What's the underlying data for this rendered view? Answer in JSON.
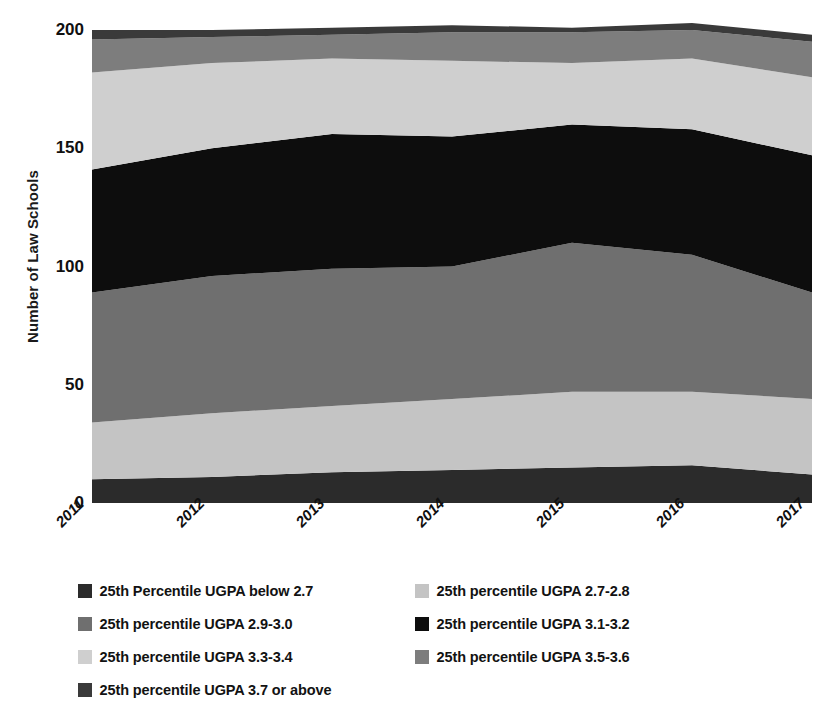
{
  "chart_data": {
    "type": "area",
    "stacked": true,
    "title": "",
    "xlabel": "",
    "ylabel": "Number of Law Schools",
    "x": [
      "2011",
      "2012",
      "2013",
      "2014",
      "2015",
      "2016",
      "2017"
    ],
    "categories": [
      "2011",
      "2012",
      "2013",
      "2014",
      "2015",
      "2016",
      "2017"
    ],
    "ylim": [
      0,
      200
    ],
    "yticks": [
      0,
      50,
      100,
      150,
      200
    ],
    "ytick_labels": [
      "0",
      "50",
      "100",
      "150",
      "200"
    ],
    "grid": false,
    "legend_position": "bottom",
    "series": [
      {
        "name": "25th Percentile UGPA below 2.7",
        "color": "#2b2b2b",
        "values": [
          10,
          11,
          13,
          14,
          15,
          16,
          12
        ]
      },
      {
        "name": "25th percentile UGPA 2.7-2.8",
        "color": "#c4c4c4",
        "values": [
          24,
          27,
          28,
          30,
          32,
          31,
          32
        ]
      },
      {
        "name": "25th percentile UGPA 2.9-3.0",
        "color": "#6f6f6f",
        "values": [
          55,
          58,
          58,
          56,
          63,
          58,
          45
        ]
      },
      {
        "name": "25th percentile UGPA 3.1-3.2",
        "color": "#0d0d0d",
        "values": [
          52,
          54,
          57,
          55,
          50,
          53,
          58
        ]
      },
      {
        "name": "25th percentile UGPA 3.3-3.4",
        "color": "#cfcfcf",
        "values": [
          41,
          36,
          32,
          32,
          26,
          30,
          33
        ]
      },
      {
        "name": "25th percentile UGPA 3.5-3.6",
        "color": "#7d7d7d",
        "values": [
          14,
          11,
          10,
          12,
          13,
          12,
          15
        ]
      },
      {
        "name": "25th percentile UGPA 3.7 or above",
        "color": "#3a3a3a",
        "values": [
          4,
          3,
          3,
          3,
          2,
          3,
          3
        ]
      }
    ],
    "cumulative_totals": [
      200,
      200,
      201,
      202,
      201,
      203,
      198
    ]
  },
  "legend": {
    "items": [
      {
        "label": "25th Percentile UGPA below 2.7",
        "color": "#2b2b2b"
      },
      {
        "label": "25th percentile UGPA 2.7-2.8",
        "color": "#c4c4c4"
      },
      {
        "label": "25th percentile UGPA 2.9-3.0",
        "color": "#6f6f6f"
      },
      {
        "label": "25th percentile UGPA 3.1-3.2",
        "color": "#0d0d0d"
      },
      {
        "label": "25th percentile UGPA 3.3-3.4",
        "color": "#cfcfcf"
      },
      {
        "label": "25th percentile UGPA 3.5-3.6",
        "color": "#7d7d7d"
      },
      {
        "label": "25th percentile UGPA 3.7 or above",
        "color": "#3a3a3a"
      }
    ]
  }
}
